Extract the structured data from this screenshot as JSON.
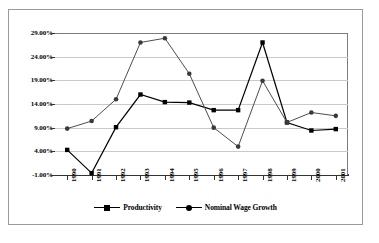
{
  "chart_data": {
    "type": "line",
    "title": "",
    "xlabel": "",
    "ylabel": "",
    "categories": [
      "1990",
      "1991",
      "1992",
      "1993",
      "1994",
      "1995",
      "1996",
      "1997",
      "1998",
      "1999",
      "2000",
      "2001"
    ],
    "ylim": [
      -1,
      29
    ],
    "ytick_labels": [
      "29.00%",
      "24.00%",
      "19.00%",
      "14.00%",
      "9.00%",
      "4.00%",
      "-1.00%"
    ],
    "ytick_values": [
      29,
      24,
      19,
      14,
      9,
      4,
      -1
    ],
    "grid": "horizontal",
    "legend_position": "bottom",
    "series": [
      {
        "name": "Productivity",
        "marker": "square",
        "color": "#000000",
        "values": [
          4.3,
          -0.6,
          9.1,
          16.0,
          14.4,
          14.3,
          12.7,
          12.7,
          27.0,
          10.1,
          8.4,
          8.7
        ]
      },
      {
        "name": "Nominal Wage Growth",
        "marker": "circle",
        "color": "#4d4d4d",
        "values": [
          8.8,
          10.4,
          15.0,
          27.0,
          27.9,
          20.4,
          9.0,
          5.0,
          18.9,
          10.1,
          12.2,
          11.5
        ]
      }
    ]
  },
  "legend": {
    "entries": [
      {
        "label": "Productivity"
      },
      {
        "label": "Nominal Wage Growth"
      }
    ]
  }
}
